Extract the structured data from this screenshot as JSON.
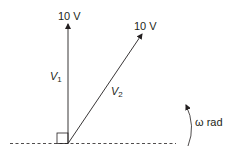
{
  "diagram": {
    "v1": {
      "magnitude_label": "10 V",
      "name": "V",
      "subscript": "1",
      "angle_deg": 90
    },
    "v2": {
      "magnitude_label": "10 V",
      "name": "V",
      "subscript": "2",
      "angle_deg": 54
    },
    "rotation_label": "ω rad",
    "colors": {
      "stroke": "#231f20",
      "background": "#ffffff"
    }
  }
}
